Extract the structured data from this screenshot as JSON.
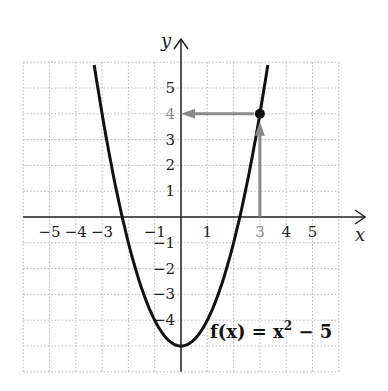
{
  "chart_data": {
    "type": "line",
    "title": "",
    "function_label": "f(x) = x² − 5",
    "function_label_parts": {
      "f": "f(x) = x",
      "exp": "2",
      "rest": " − 5"
    },
    "xlabel": "x",
    "ylabel": "y",
    "xlim": [
      -6,
      6
    ],
    "ylim": [
      -6,
      6
    ],
    "grid": true,
    "grid_style": "dotted",
    "x_ticks": [
      {
        "value": -5,
        "label": "−5"
      },
      {
        "value": -4,
        "label": "−4"
      },
      {
        "value": -3,
        "label": "−3"
      },
      {
        "value": -1,
        "label": "−1"
      },
      {
        "value": 1,
        "label": "1"
      },
      {
        "value": 3,
        "label": "3",
        "highlight": true
      },
      {
        "value": 4,
        "label": "4"
      },
      {
        "value": 5,
        "label": "5"
      }
    ],
    "y_ticks": [
      {
        "value": 5,
        "label": "5"
      },
      {
        "value": 4,
        "label": "4",
        "highlight": true
      },
      {
        "value": 3,
        "label": "3"
      },
      {
        "value": 2,
        "label": "2"
      },
      {
        "value": 1,
        "label": "1"
      },
      {
        "value": -1,
        "label": "−1"
      },
      {
        "value": -2,
        "label": "−2"
      },
      {
        "value": -3,
        "label": "−3"
      },
      {
        "value": -4,
        "label": "−4"
      }
    ],
    "series": [
      {
        "name": "f(x) = x² − 5",
        "formula": "x^2 - 5",
        "x_range": [
          -3.3,
          3.3
        ],
        "color": "#111111"
      }
    ],
    "highlight_point": {
      "x": 3,
      "y": 4
    },
    "annotations": [
      {
        "type": "arrow",
        "from": [
          3,
          0
        ],
        "to": [
          3,
          4
        ],
        "color": "#8a8a8a"
      },
      {
        "type": "arrow",
        "from": [
          3,
          4
        ],
        "to": [
          0,
          4
        ],
        "color": "#8a8a8a"
      }
    ]
  }
}
